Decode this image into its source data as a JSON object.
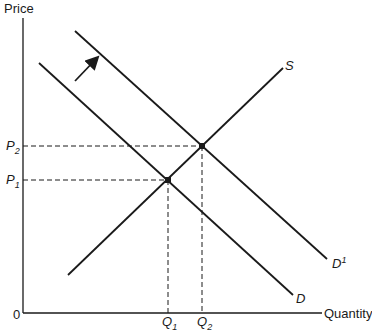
{
  "diagram": {
    "type": "supply-demand-shift",
    "axes": {
      "y_label": "Price",
      "x_label": "Quantity",
      "origin_label": "0"
    },
    "curves": {
      "supply": {
        "label": "S"
      },
      "demand_original": {
        "label": "D"
      },
      "demand_shifted": {
        "label": "D",
        "prime": "1"
      }
    },
    "equilibria": [
      {
        "price_label": "P",
        "price_sub": "1",
        "quantity_label": "Q",
        "quantity_sub": "1"
      },
      {
        "price_label": "P",
        "price_sub": "2",
        "quantity_label": "Q",
        "quantity_sub": "2"
      }
    ],
    "annotations": {
      "shift_arrow": "demand shifts outward (right)"
    },
    "colors": {
      "ink": "#1a1a1a",
      "background": "#ffffff"
    }
  }
}
